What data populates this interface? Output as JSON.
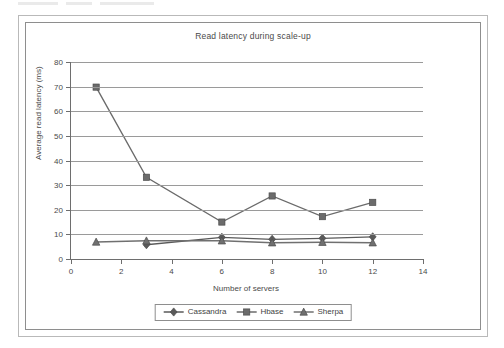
{
  "chart_data": {
    "type": "line",
    "title": "Read latency during scale-up",
    "xlabel": "Number of servers",
    "ylabel": "Average read latency (ms)",
    "x": [
      1,
      3,
      6,
      8,
      10,
      12
    ],
    "xlim": [
      0,
      14
    ],
    "ylim": [
      0,
      80
    ],
    "xticks": [
      0,
      2,
      4,
      6,
      8,
      10,
      12,
      14
    ],
    "yticks": [
      0,
      10,
      20,
      30,
      40,
      50,
      60,
      70,
      80
    ],
    "grid": "horizontal",
    "legend_position": "bottom",
    "series": [
      {
        "name": "Cassandra",
        "marker": "diamond",
        "color": "#5a5a5a",
        "values": [
          null,
          5.8,
          8.8,
          8.0,
          8.4,
          9.0
        ]
      },
      {
        "name": "Hbase",
        "marker": "square",
        "color": "#6b6b6b",
        "values": [
          69.8,
          33.2,
          15.0,
          25.6,
          17.2,
          23.0
        ]
      },
      {
        "name": "Sherpa",
        "marker": "triangle",
        "color": "#707070",
        "values": [
          6.9,
          7.4,
          7.4,
          6.6,
          6.8,
          6.6
        ]
      }
    ]
  },
  "axes": {
    "y_tick_labels": [
      "80",
      "70",
      "60",
      "50",
      "40",
      "30",
      "20",
      "10",
      "0"
    ],
    "x_tick_labels": [
      "0",
      "2",
      "4",
      "6",
      "8",
      "10",
      "12",
      "14"
    ]
  },
  "legend": {
    "items": [
      {
        "label": "Cassandra",
        "marker": "diamond"
      },
      {
        "label": "Hbase",
        "marker": "square"
      },
      {
        "label": "Sherpa",
        "marker": "triangle"
      }
    ]
  }
}
